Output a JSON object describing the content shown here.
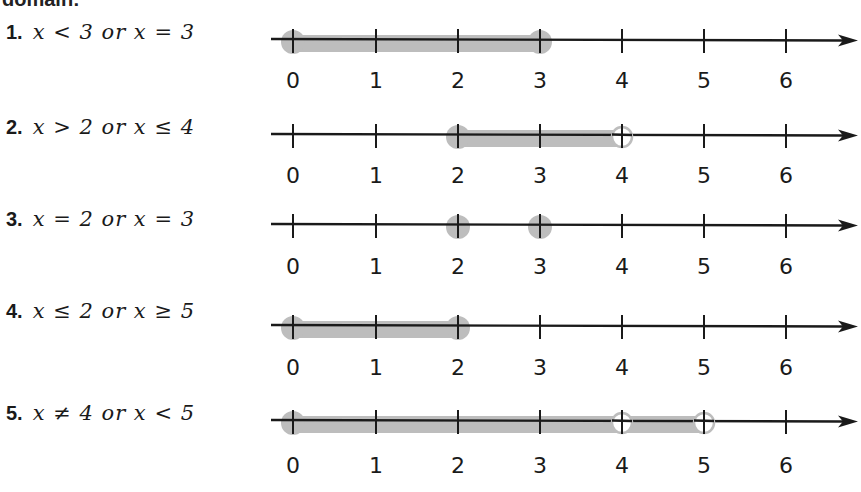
{
  "heading_fragment": "domain:",
  "axis": {
    "ticks": [
      0,
      1,
      2,
      3,
      4,
      5,
      6
    ],
    "tick_x": [
      293,
      376,
      458,
      540,
      622,
      704,
      786
    ],
    "line_start_x": 271,
    "arrow_tip_x": 858,
    "shade_color": "#bdbdbd",
    "line_color": "#1a1a1a"
  },
  "problems": [
    {
      "number": "1.",
      "expression": "x < 3 or x = 3",
      "axis_y": 39,
      "label_y": 80,
      "shade": [
        [
          0,
          3
        ]
      ],
      "filled_points": [
        0,
        3
      ],
      "open_points": []
    },
    {
      "number": "2.",
      "expression": "x > 2 or x ≤ 4",
      "axis_y": 134,
      "label_y": 175,
      "shade": [
        [
          2,
          4
        ]
      ],
      "filled_points": [
        2
      ],
      "open_points": [
        4
      ]
    },
    {
      "number": "3.",
      "expression": "x = 2 or x = 3",
      "axis_y": 224,
      "label_y": 266,
      "shade": [],
      "filled_points": [
        2,
        3
      ],
      "open_points": []
    },
    {
      "number": "4.",
      "expression": "x ≤ 2 or x ≥ 5",
      "axis_y": 325,
      "label_y": 367,
      "shade": [
        [
          0,
          2
        ]
      ],
      "filled_points": [
        0,
        2
      ],
      "open_points": []
    },
    {
      "number": "5.",
      "expression": "x ≠ 4 or x < 5",
      "axis_y": 420,
      "label_y": 465,
      "shade": [
        [
          0,
          5
        ]
      ],
      "filled_points": [
        0
      ],
      "open_points": [
        4,
        5
      ]
    }
  ]
}
